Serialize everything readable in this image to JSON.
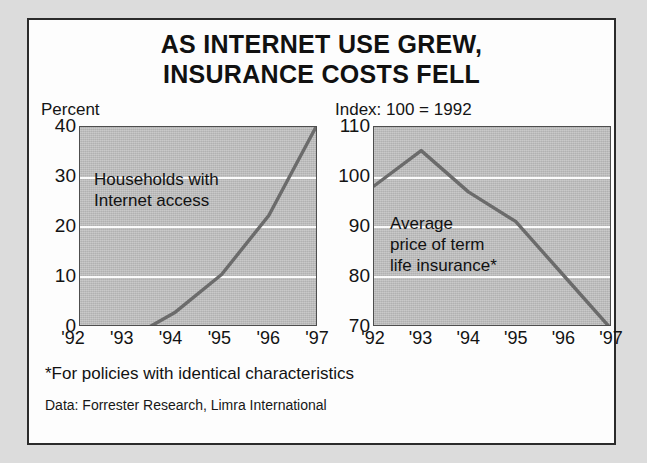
{
  "title": {
    "line1": "AS INTERNET USE GREW,",
    "line2": "INSURANCE COSTS FELL"
  },
  "footnote": "*For policies with identical characteristics",
  "source": "Data: Forrester Research, Limra International",
  "colors": {
    "plot_background": "#c2c2c2",
    "line": "#6b6b6b",
    "gridline": "#fbfbfb",
    "border": "#2b2b2b",
    "text": "#121212"
  },
  "chart_data": [
    {
      "type": "line",
      "id": "households-with-internet-access",
      "title": "AS INTERNET USE GREW, INSURANCE COSTS FELL",
      "ylabel": "Percent",
      "xlabel": "",
      "annotation": "Households with\nInternet access",
      "annotation_line1": "Households with",
      "annotation_line2": "Internet access",
      "categories": [
        "'92",
        "'93",
        "'94",
        "'95",
        "'96",
        "'97"
      ],
      "x": [
        "'92",
        "'93",
        "'94",
        "'95",
        "'96",
        "'97"
      ],
      "values": [
        1.5,
        4,
        8.5,
        15,
        25,
        40
      ],
      "ytick_labels": [
        "40",
        "30",
        "20",
        "10",
        "0"
      ],
      "yticks": [
        40,
        30,
        20,
        10,
        0
      ],
      "ylim": [
        0,
        40
      ],
      "gridlines": [
        30,
        20,
        10
      ],
      "grid": true,
      "legend": "none"
    },
    {
      "type": "line",
      "id": "average-price-of-term-life-insurance",
      "title": "AS INTERNET USE GREW, INSURANCE COSTS FELL",
      "ylabel": "Index: 100 = 1992",
      "xlabel": "",
      "annotation": "Average\nprice of term\nlife insurance*",
      "annotation_line1": "Average",
      "annotation_line2": "price of term",
      "annotation_line3": "life insurance*",
      "categories": [
        "'92",
        "'93",
        "'94",
        "'95",
        "'96",
        "'97"
      ],
      "x": [
        "'92",
        "'93",
        "'94",
        "'95",
        "'96",
        "'97"
      ],
      "values": [
        100,
        106,
        99,
        94,
        85,
        76
      ],
      "ytick_labels": [
        "110",
        "100",
        "90",
        "80",
        "70"
      ],
      "yticks": [
        110,
        100,
        90,
        80,
        70
      ],
      "ylim": [
        70,
        110
      ],
      "gridlines": [
        100,
        90,
        80
      ],
      "grid": true,
      "legend": "none"
    }
  ]
}
